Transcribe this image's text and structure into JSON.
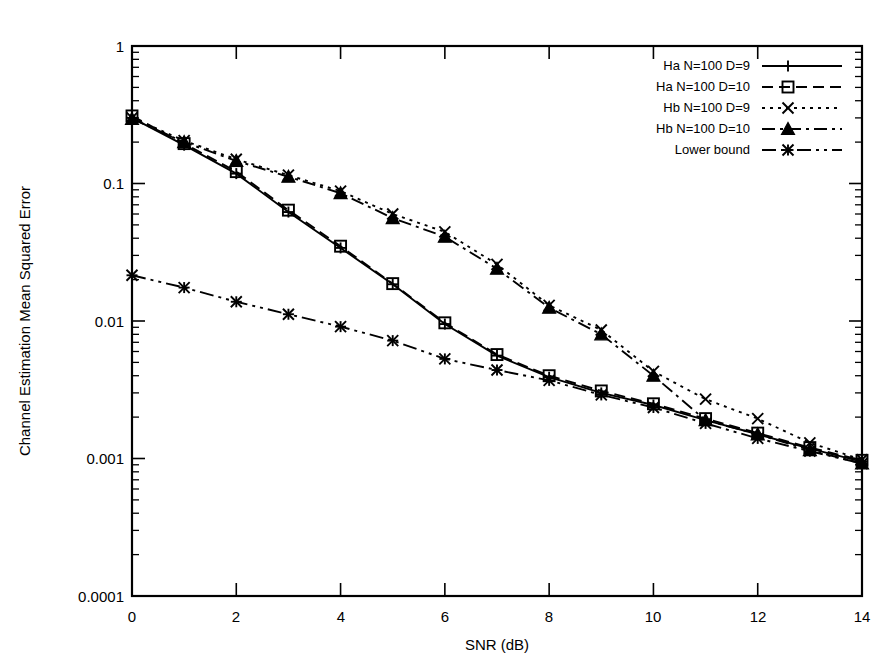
{
  "chart_data": {
    "type": "line",
    "title": "",
    "xlabel": "SNR (dB)",
    "ylabel": "Channel Estimation Mean Squared Error",
    "x": [
      0,
      1,
      2,
      3,
      4,
      5,
      6,
      7,
      8,
      9,
      10,
      11,
      12,
      13,
      14
    ],
    "xlim": [
      0,
      14
    ],
    "ylim": [
      0.0001,
      1
    ],
    "yscale": "log",
    "xticks": [
      0,
      2,
      4,
      6,
      8,
      10,
      12,
      14
    ],
    "xtick_labels": [
      "0",
      "2",
      "4",
      "6",
      "8",
      "10",
      "12",
      "14"
    ],
    "yticks": [
      0.0001,
      0.001,
      0.01,
      0.1,
      1
    ],
    "ytick_labels": [
      "0.0001",
      "0.001",
      "0.01",
      "0.1",
      "1"
    ],
    "grid": false,
    "legend_position": "top-right",
    "series": [
      {
        "name": "Ha N=100 D=9",
        "marker": "plus",
        "dash": "solid",
        "values": [
          0.3,
          0.19,
          0.118,
          0.062,
          0.034,
          0.0185,
          0.0095,
          0.0056,
          0.0039,
          0.003,
          0.00245,
          0.0019,
          0.0015,
          0.00118,
          0.00095
        ]
      },
      {
        "name": "Ha N=100 D=10",
        "marker": "square",
        "dash": "dashed",
        "values": [
          0.31,
          0.195,
          0.122,
          0.064,
          0.035,
          0.0187,
          0.0097,
          0.0057,
          0.004,
          0.0031,
          0.0025,
          0.00195,
          0.00153,
          0.0012,
          0.00097
        ]
      },
      {
        "name": "Hb N=100 D=9",
        "marker": "cross",
        "dash": "dotted",
        "values": [
          0.3,
          0.205,
          0.15,
          0.115,
          0.088,
          0.06,
          0.0445,
          0.0258,
          0.013,
          0.0086,
          0.0043,
          0.0027,
          0.00195,
          0.0013,
          0.00098
        ]
      },
      {
        "name": "Hb N=100 D=10",
        "marker": "triangle",
        "dash": "dashdot",
        "values": [
          0.295,
          0.2,
          0.146,
          0.112,
          0.085,
          0.056,
          0.041,
          0.024,
          0.0125,
          0.008,
          0.004,
          0.0019,
          0.0015,
          0.00115,
          0.00092
        ]
      },
      {
        "name": "Lower bound",
        "marker": "starburst",
        "dash": "dashdotdot",
        "values": [
          0.0215,
          0.0175,
          0.0138,
          0.0112,
          0.0091,
          0.0072,
          0.0053,
          0.0044,
          0.0037,
          0.0029,
          0.00235,
          0.0018,
          0.0014,
          0.00113,
          0.00092
        ]
      }
    ]
  },
  "axis": {
    "x_title": "SNR (dB)",
    "y_title": "Channel Estimation Mean Squared Error",
    "y_labels": {
      "l0": "1",
      "l1": "0.1",
      "l2": "0.01",
      "l3": "0.001",
      "l4": "0.0001"
    },
    "x_labels": {
      "t0": "0",
      "t1": "2",
      "t2": "4",
      "t3": "6",
      "t4": "8",
      "t5": "10",
      "t6": "12",
      "t7": "14"
    }
  },
  "legend": {
    "entries": [
      {
        "label": "Ha N=100 D=9"
      },
      {
        "label": "Ha N=100 D=10"
      },
      {
        "label": "Hb N=100 D=9"
      },
      {
        "label": "Hb N=100 D=10"
      },
      {
        "label": "Lower bound"
      }
    ]
  },
  "colors": {
    "ink": "#000000",
    "background": "#ffffff"
  }
}
